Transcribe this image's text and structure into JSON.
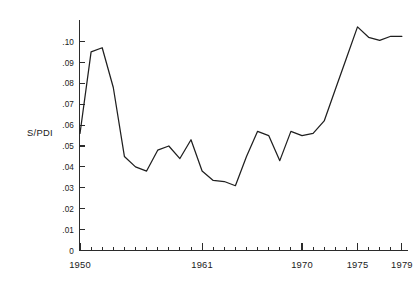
{
  "chart_data": {
    "type": "line",
    "title": "",
    "subtitle": "",
    "xlabel": "",
    "ylabel": "S/PDI",
    "ylabel_position": "left-middle",
    "grid": false,
    "legend": "none",
    "xlim": [
      1950,
      1980
    ],
    "ylim": [
      0,
      0.11
    ],
    "x_tick_labels": [
      "1950",
      "1961",
      "1970",
      "1975",
      "1979"
    ],
    "x_tick_label_values": [
      1950,
      1961,
      1970,
      1975,
      1979
    ],
    "x_minor_tick_step": 1,
    "y_tick_labels": [
      "0",
      ".01",
      ".02",
      ".03",
      ".04",
      ".05",
      ".06",
      ".07",
      ".08",
      ".09",
      ".10"
    ],
    "y_tick_values": [
      0,
      0.01,
      0.02,
      0.03,
      0.04,
      0.05,
      0.06,
      0.07,
      0.08,
      0.09,
      0.1
    ],
    "line_color": "#1f1f1f",
    "axis_color": "#2b2b2b",
    "background_color": "#ffffff",
    "x": [
      1950,
      1951,
      1952,
      1953,
      1954,
      1955,
      1956,
      1957,
      1958,
      1959,
      1960,
      1961,
      1962,
      1963,
      1964,
      1965,
      1966,
      1967,
      1968,
      1969,
      1970,
      1971,
      1972,
      1973,
      1974,
      1975,
      1976,
      1977,
      1978,
      1979
    ],
    "values": [
      0.056,
      0.095,
      0.097,
      0.078,
      0.045,
      0.04,
      0.038,
      0.048,
      0.05,
      0.044,
      0.053,
      0.038,
      0.0335,
      0.033,
      0.031,
      0.045,
      0.057,
      0.055,
      0.043,
      0.057,
      0.055,
      0.056,
      0.062,
      0.077,
      0.092,
      0.107,
      0.102,
      0.1005,
      0.1025,
      0.1025
    ],
    "series": [
      {
        "name": "S/PDI",
        "values": [
          0.056,
          0.095,
          0.097,
          0.078,
          0.045,
          0.04,
          0.038,
          0.048,
          0.05,
          0.044,
          0.053,
          0.038,
          0.0335,
          0.033,
          0.031,
          0.045,
          0.057,
          0.055,
          0.043,
          0.057,
          0.055,
          0.056,
          0.062,
          0.077,
          0.092,
          0.107,
          0.102,
          0.1005,
          0.1025,
          0.1025
        ]
      }
    ],
    "annotations": []
  },
  "axis": {
    "y_axis_title": "S/PDI",
    "y_ticks": [
      {
        "label": "0",
        "value": 0
      },
      {
        "label": ".01",
        "value": 0.01
      },
      {
        "label": ".02",
        "value": 0.02
      },
      {
        "label": ".03",
        "value": 0.03
      },
      {
        "label": ".04",
        "value": 0.04
      },
      {
        "label": ".05",
        "value": 0.05
      },
      {
        "label": ".06",
        "value": 0.06
      },
      {
        "label": ".07",
        "value": 0.07
      },
      {
        "label": ".08",
        "value": 0.08
      },
      {
        "label": ".09",
        "value": 0.09
      },
      {
        "label": ".10",
        "value": 0.1
      }
    ],
    "x_ticks": [
      {
        "label": "1950",
        "value": 1950
      },
      {
        "label": "1961",
        "value": 1961
      },
      {
        "label": "1970",
        "value": 1970
      },
      {
        "label": "1975",
        "value": 1975
      },
      {
        "label": "1979",
        "value": 1979
      }
    ]
  }
}
